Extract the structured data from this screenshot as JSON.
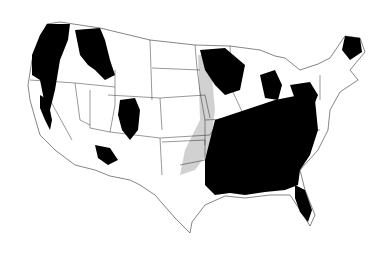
{
  "map": {
    "title": "",
    "region": "Contiguous United States",
    "legend": [],
    "colors": {
      "forest": "#000000",
      "background": "#ffffff",
      "sparse": "#bbbbbb"
    },
    "regions": [
      {
        "name": "pacific-northwest",
        "class": "forest"
      },
      {
        "name": "northern-rockies",
        "class": "forest"
      },
      {
        "name": "sierra-nevada",
        "class": "forest"
      },
      {
        "name": "southern-rockies",
        "class": "forest"
      },
      {
        "name": "arizona-new-mexico-highlands",
        "class": "forest"
      },
      {
        "name": "upper-great-lakes",
        "class": "forest"
      },
      {
        "name": "michigan",
        "class": "forest"
      },
      {
        "name": "southeast",
        "class": "forest"
      },
      {
        "name": "appalachia",
        "class": "forest"
      },
      {
        "name": "new-england",
        "class": "forest"
      },
      {
        "name": "florida",
        "class": "forest"
      },
      {
        "name": "prairie-transition",
        "class": "sparse"
      }
    ]
  }
}
